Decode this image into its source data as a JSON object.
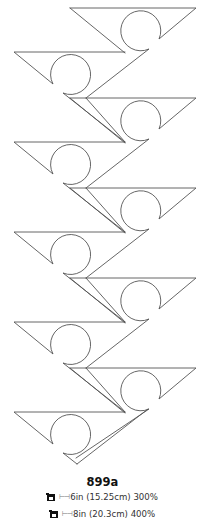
{
  "design": {
    "code": "899a",
    "pattern": {
      "motif": "triangle-with-circle-notch",
      "right_pointing_units": 5,
      "left_pointing_units": 5,
      "line_color": "#555555"
    }
  },
  "sizes": [
    {
      "hoop_icon": "hoop-icon",
      "measure_icon": "width-arrow-icon",
      "measure_glyph": "⊢⊣",
      "label": "6in (15.25cm) 300%"
    },
    {
      "hoop_icon": "hoop-icon",
      "measure_icon": "width-arrow-icon",
      "measure_glyph": "⊢⊣",
      "label": "8in (20.3cm) 400%"
    }
  ]
}
